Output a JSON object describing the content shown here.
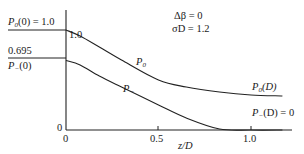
{
  "chart_data": {
    "type": "line",
    "title": "",
    "xlabel": "z/D",
    "ylabel": "",
    "xlim": [
      0,
      1.1
    ],
    "ylim": [
      0,
      1.0
    ],
    "grid": false,
    "x_ticks": [
      "0",
      "0.5",
      "1.0"
    ],
    "y_ticks": [
      "0",
      "1.0"
    ],
    "parameters": [
      "Δβ = 0",
      "σD = 1.2"
    ],
    "series": [
      {
        "name": "P0",
        "label": "P0",
        "x": [
          0,
          0.076,
          0.18,
          0.3,
          0.5,
          0.65,
          0.83,
          1.0,
          1.17
        ],
        "y": [
          1.0,
          0.94,
          0.83,
          0.7,
          0.5,
          0.43,
          0.38,
          0.35,
          0.34
        ]
      },
      {
        "name": "P-",
        "label": "P-",
        "x": [
          0,
          0.076,
          0.18,
          0.3,
          0.5,
          0.65,
          0.83,
          1.0,
          1.17
        ],
        "y": [
          0.695,
          0.65,
          0.54,
          0.43,
          0.25,
          0.12,
          0.01,
          0.0,
          0.0
        ]
      }
    ],
    "annotations": [
      "P0(0) = 1.0",
      "0.695",
      "P-(0)",
      "P0(D)",
      "P-(D) = 0",
      "1.0"
    ]
  },
  "labels": {
    "p0_init_P": "P",
    "p0_init_sub": "0",
    "p0_init_rest": "(0) = 1.0",
    "pm_value": "0.695",
    "pm_init_P": "P",
    "pm_init_sub": "−",
    "pm_init_rest": "(0)",
    "yaxis_top": "1.0",
    "yaxis_zero": "0",
    "xtick_0": "0",
    "xtick_05": "0.5",
    "xtick_10": "1.0",
    "xlabel": "z/D",
    "param1": "Δβ = 0",
    "param2": "σD = 1.2",
    "curve_p0_P": "P",
    "curve_p0_sub": "0",
    "curve_pm_P": "P",
    "curve_pm_sub": "−",
    "end_p0_P": "P",
    "end_p0_sub": "0",
    "end_p0_rest": "(D)",
    "end_pm_P": "P",
    "end_pm_sub": "−",
    "end_pm_rest": "(D) = 0"
  }
}
